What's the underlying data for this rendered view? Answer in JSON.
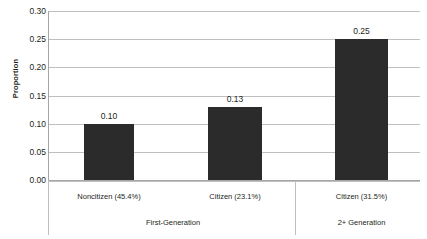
{
  "chart_data": {
    "type": "bar",
    "title": "",
    "xlabel": "",
    "ylabel": "Proportion",
    "ylim": [
      0.0,
      0.3
    ],
    "grid": true,
    "legend": "none",
    "categories": [
      "Noncitizen (45.4%)",
      "Citizen (23.1%)",
      "Citizen (31.5%)"
    ],
    "values": [
      0.1,
      0.13,
      0.25
    ],
    "data_labels": [
      "0.10",
      "0.13",
      "0.25"
    ],
    "group_labels": [
      "First-Generation",
      "2+ Generation"
    ],
    "group_spans": [
      2,
      1
    ],
    "yticks": [
      "0.30",
      "0.25",
      "0.20",
      "0.15",
      "0.10",
      "0.05",
      "0.00"
    ],
    "ytick_values": [
      0.3,
      0.25,
      0.2,
      0.15,
      0.1,
      0.05,
      0.0
    ],
    "colors": {
      "bar": "#2b2b2b",
      "grid": "#bfbfbf",
      "axis": "#a6a6a6",
      "text": "#231f20",
      "background": "#ffffff"
    }
  }
}
